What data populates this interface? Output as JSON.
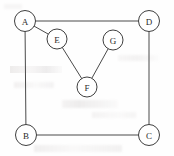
{
  "diagram": {
    "type": "node-link-graph",
    "canvas": {
      "width": 174,
      "height": 156
    },
    "style": {
      "background_color": "#fefefe",
      "node_fill": "#ffffff",
      "node_stroke": "#3f3f3f",
      "edge_stroke": "#4a4a4a",
      "label_color": "#2b2b2b",
      "node_radius": 10.5,
      "stroke_width": 1
    },
    "nodes": [
      {
        "id": "A",
        "label": "A",
        "cx": 25,
        "cy": 21,
        "r": 10.5
      },
      {
        "id": "D",
        "label": "D",
        "cx": 149,
        "cy": 21,
        "r": 10.5
      },
      {
        "id": "E",
        "label": "E",
        "cx": 57,
        "cy": 39,
        "r": 10.0
      },
      {
        "id": "G",
        "label": "G",
        "cx": 113,
        "cy": 40,
        "r": 10.0
      },
      {
        "id": "F",
        "label": "F",
        "cx": 87,
        "cy": 87,
        "r": 10.0
      },
      {
        "id": "B",
        "label": "B",
        "cx": 26,
        "cy": 135,
        "r": 10.5
      },
      {
        "id": "C",
        "label": "C",
        "cx": 149,
        "cy": 135,
        "r": 10.5
      }
    ],
    "edges": [
      {
        "id": "A-D",
        "source": "A",
        "target": "D"
      },
      {
        "id": "A-B",
        "source": "A",
        "target": "B"
      },
      {
        "id": "B-C",
        "source": "B",
        "target": "C"
      },
      {
        "id": "C-D",
        "source": "C",
        "target": "D"
      },
      {
        "id": "A-E",
        "source": "A",
        "target": "E"
      },
      {
        "id": "E-F",
        "source": "E",
        "target": "F"
      },
      {
        "id": "F-G",
        "source": "F",
        "target": "G"
      }
    ]
  }
}
